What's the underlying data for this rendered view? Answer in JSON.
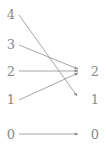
{
  "diagram": {
    "type": "bipartite-mapping",
    "style": {
      "stroke_color": "#8f8f8f",
      "label_color": "#8a8a8a",
      "background": "#ffffff",
      "stroke_width": 0.8
    },
    "left_column": {
      "name": "domain",
      "nodes": [
        {
          "label": "4",
          "x": 11,
          "y": 14
        },
        {
          "label": "3",
          "x": 11,
          "y": 44
        },
        {
          "label": "2",
          "x": 11,
          "y": 71
        },
        {
          "label": "1",
          "x": 11,
          "y": 99
        },
        {
          "label": "0",
          "x": 11,
          "y": 134
        }
      ]
    },
    "right_column": {
      "name": "codomain",
      "nodes": [
        {
          "label": "2",
          "x": 95,
          "y": 71
        },
        {
          "label": "1",
          "x": 95,
          "y": 99
        },
        {
          "label": "0",
          "x": 95,
          "y": 134
        }
      ]
    },
    "edges": [
      {
        "from": "4",
        "to": "1",
        "x1": 19,
        "y1": 15,
        "x2": 77,
        "y2": 96
      },
      {
        "from": "3",
        "to": "2",
        "x1": 19,
        "y1": 45,
        "x2": 78,
        "y2": 69
      },
      {
        "from": "2",
        "to": "2",
        "x1": 19,
        "y1": 71,
        "x2": 78,
        "y2": 71
      },
      {
        "from": "1",
        "to": "2",
        "x1": 19,
        "y1": 100,
        "x2": 78,
        "y2": 73
      },
      {
        "from": "0",
        "to": "0",
        "x1": 19,
        "y1": 134,
        "x2": 78,
        "y2": 134
      }
    ]
  }
}
